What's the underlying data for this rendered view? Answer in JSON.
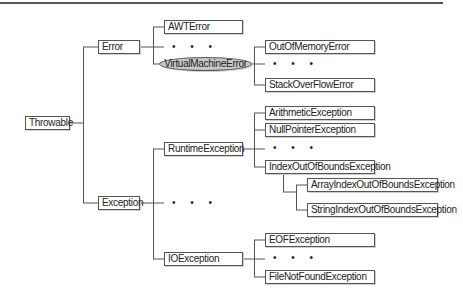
{
  "diagram": {
    "root": {
      "label": "Throwable"
    },
    "nodes": {
      "throwable": "Throwable",
      "error": "Error",
      "exception": "Exception",
      "awt_error": "AWTError",
      "virtual_machine_error": "VirtualMachineError",
      "out_of_memory_error": "OutOfMemoryError",
      "stack_overflow_error": "StackOverFlowError",
      "runtime_exception": "RuntimeException",
      "arithmetic_exception": "ArithmeticException",
      "null_pointer_exception": "NullPointerException",
      "index_out_of_bounds_exception": "IndexOutOfBoundsException",
      "array_index_out_of_bounds_exception": "ArrayIndexOutOfBoundsException",
      "string_index_out_of_bounds_exception": "StringIndexOutOfBoundsException",
      "io_exception": "IOException",
      "eof_exception": "EOFException",
      "file_not_found_exception": "FileNotFoundException"
    },
    "ellipsis": "• • •",
    "highlighted_node": "VirtualMachineError",
    "colors": {
      "line": "#555555",
      "highlight_fill": "#c8c8c8",
      "box_fill": "#ffffff"
    },
    "edges": [
      [
        "Throwable",
        "Error"
      ],
      [
        "Throwable",
        "Exception"
      ],
      [
        "Error",
        "AWTError"
      ],
      [
        "Error",
        "..."
      ],
      [
        "Error",
        "VirtualMachineError"
      ],
      [
        "VirtualMachineError",
        "OutOfMemoryError"
      ],
      [
        "VirtualMachineError",
        "..."
      ],
      [
        "VirtualMachineError",
        "StackOverFlowError"
      ],
      [
        "Exception",
        "RuntimeException"
      ],
      [
        "Exception",
        "..."
      ],
      [
        "Exception",
        "IOException"
      ],
      [
        "RuntimeException",
        "ArithmeticException"
      ],
      [
        "RuntimeException",
        "NullPointerException"
      ],
      [
        "RuntimeException",
        "..."
      ],
      [
        "RuntimeException",
        "IndexOutOfBoundsException"
      ],
      [
        "IndexOutOfBoundsException",
        "ArrayIndexOutOfBoundsException"
      ],
      [
        "IndexOutOfBoundsException",
        "StringIndexOutOfBoundsException"
      ],
      [
        "IOException",
        "EOFException"
      ],
      [
        "IOException",
        "..."
      ],
      [
        "IOException",
        "FileNotFoundException"
      ]
    ]
  }
}
